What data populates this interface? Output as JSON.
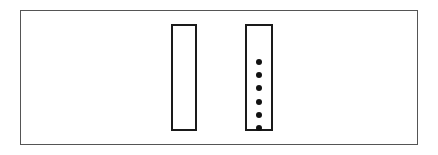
{
  "figure": {
    "kind": "schematic-diagram",
    "width": 438,
    "height": 155,
    "background_color": "#ffffff"
  },
  "outer_frame": {
    "label": "outer frame",
    "x": 20,
    "y": 10,
    "width": 398,
    "height": 135,
    "border_width": 1,
    "border_color": "#555555",
    "fill_color": "transparent"
  },
  "shapes": [
    {
      "id": "left-rectangle",
      "label": "empty rectangle",
      "x": 171,
      "y": 24,
      "width": 26,
      "height": 107,
      "border_width": 2,
      "border_color": "#1a1a1a",
      "fill_color": "#ffffff",
      "contents": "empty",
      "item_count": 0
    },
    {
      "id": "right-rectangle",
      "label": "rectangle with dots",
      "x": 245,
      "y": 24,
      "width": 28,
      "height": 107,
      "border_width": 2,
      "border_color": "#1a1a1a",
      "fill_color": "#ffffff",
      "contents": "dots",
      "item_count": 6
    }
  ],
  "dot_column": {
    "label": "column of filled dots",
    "count": 6,
    "dot_diameter": 6,
    "dot_color": "#111111",
    "x": 252,
    "y": 59,
    "width": 14,
    "height": 72,
    "spacing": 13,
    "dots": [
      {
        "index": 1,
        "cx": 259,
        "cy": 62
      },
      {
        "index": 2,
        "cx": 259,
        "cy": 75
      },
      {
        "index": 3,
        "cx": 259,
        "cy": 88
      },
      {
        "index": 4,
        "cx": 259,
        "cy": 101
      },
      {
        "index": 5,
        "cx": 259,
        "cy": 115
      },
      {
        "index": 6,
        "cx": 259,
        "cy": 128
      }
    ]
  }
}
